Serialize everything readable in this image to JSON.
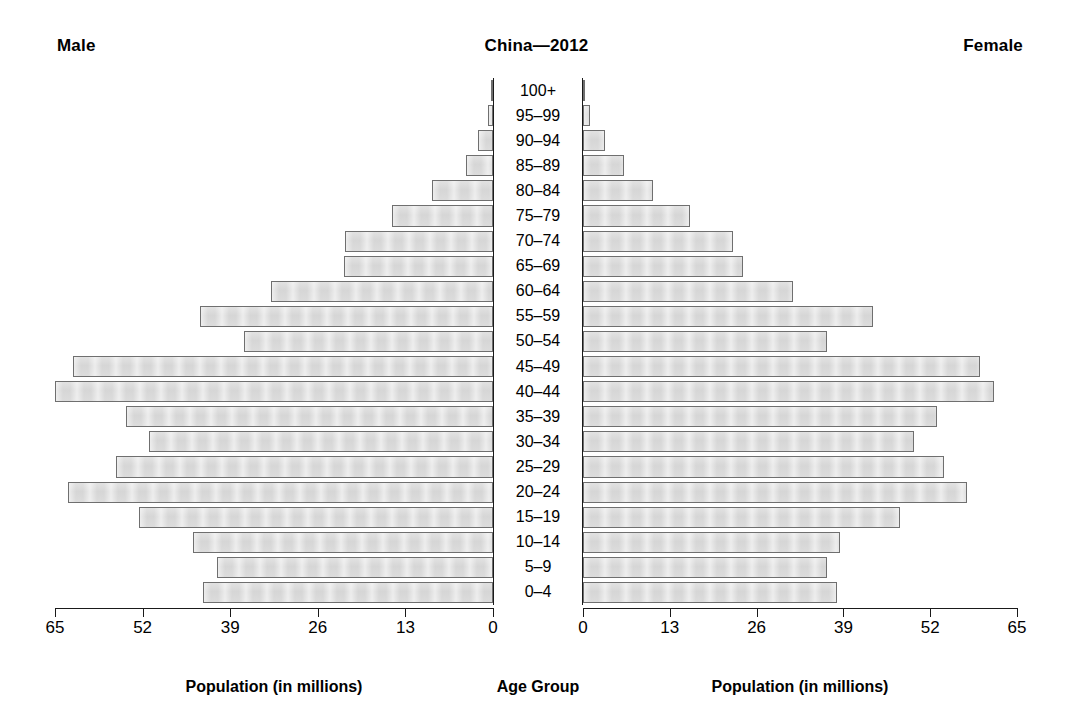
{
  "header": {
    "left_label": "Male",
    "title": "China—2012",
    "right_label": "Female"
  },
  "axis_titles": {
    "left": "Population (in millions)",
    "center": "Age Group",
    "right": "Population (in millions)"
  },
  "colors": {
    "bar_fill": "#d9d9d9",
    "bar_border": "#6f6f6f",
    "axis": "#1a1a1a",
    "text": "#000000",
    "background": "#ffffff"
  },
  "chart_data": {
    "type": "bar",
    "subtype": "population-pyramid",
    "title": "China—2012",
    "xlabel": "Population (in millions)",
    "ylabel": "Age Group",
    "grid": false,
    "legend": [
      "Male",
      "Female"
    ],
    "legend_position": "top-corners",
    "xlim_left": [
      65,
      0
    ],
    "xlim_right": [
      0,
      65
    ],
    "xticks_left": [
      65,
      52,
      39,
      26,
      13,
      0
    ],
    "xticks_right": [
      0,
      13,
      26,
      39,
      52,
      65
    ],
    "units": "millions",
    "categories": [
      "100+",
      "95–99",
      "90–94",
      "85–89",
      "80–84",
      "75–79",
      "70–74",
      "65–69",
      "60–64",
      "55–59",
      "50–54",
      "45–49",
      "40–44",
      "35–39",
      "30–34",
      "25–29",
      "20–24",
      "15–19",
      "10–14",
      "5–9",
      "0–4"
    ],
    "series": [
      {
        "name": "Male",
        "side": "left",
        "values": [
          0.2,
          0.7,
          2.3,
          4.0,
          9.0,
          15.0,
          22.0,
          22.1,
          33.0,
          43.5,
          37.0,
          62.3,
          65.0,
          54.5,
          51.0,
          56.0,
          63.0,
          52.5,
          44.5,
          41.0,
          43.0
        ]
      },
      {
        "name": "Female",
        "side": "right",
        "values": [
          0.3,
          1.1,
          3.3,
          6.2,
          10.5,
          16.0,
          22.5,
          24.0,
          31.5,
          43.5,
          36.5,
          59.4,
          61.5,
          53.0,
          49.5,
          54.0,
          57.5,
          47.5,
          38.5,
          36.5,
          38.0
        ]
      }
    ]
  }
}
